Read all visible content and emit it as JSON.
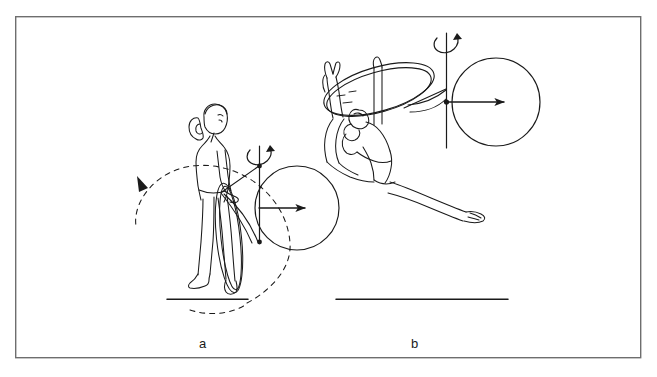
{
  "figure": {
    "type": "line-drawing-diagram",
    "background_color": "#ffffff",
    "ink_color": "#1a1a1a",
    "border": {
      "name": "figure-border",
      "x": 15,
      "y": 16,
      "width": 626,
      "height": 342,
      "stroke": "#6e6e6e",
      "stroke_width": 1.4
    },
    "panels": [
      {
        "id": "a",
        "label": "a",
        "label_x": 199,
        "label_y": 337,
        "description": "Gymnast standing upright in profile holding a hoop at the hip; dashed circular arrow shows hoop swing path; vertical rotation axis with curved spin arrow and a circle with a horizontal arrow representing the angular momentum vector.",
        "ground_line": {
          "x1": 167,
          "y1": 299,
          "x2": 248,
          "y2": 299
        },
        "axis": {
          "x": 259,
          "y_top": 146,
          "y_bottom": 243
        },
        "spin_arrow": {
          "cx": 264,
          "cy": 152,
          "direction": "counterclockwise-about-vertical-axis"
        },
        "momentum_circle": {
          "cx": 297,
          "cy": 208,
          "r": 42
        },
        "momentum_arrow": {
          "x1": 259,
          "y1": 208,
          "x2": 307,
          "y2": 208,
          "direction": "right"
        },
        "dashed_arc": {
          "description": "dashed near-full circle traced counterclockwise with arrowhead at upper left",
          "cx": 212,
          "cy": 245,
          "rx": 78,
          "ry": 73
        }
      },
      {
        "id": "b",
        "label": "b",
        "label_x": 411,
        "label_y": 337,
        "description": "Gymnast in a horizontal flight / split-leap position passing through the hoop; vertical rotation axis with curved spin arrow and a circle with a horizontal arrow representing the angular momentum vector.",
        "ground_line": {
          "x1": 336,
          "y1": 299,
          "x2": 508,
          "y2": 299
        },
        "axis": {
          "x": 446,
          "y_top": 33,
          "y_bottom": 148
        },
        "spin_arrow": {
          "cx": 451,
          "cy": 40,
          "direction": "counterclockwise-about-vertical-axis"
        },
        "momentum_circle": {
          "cx": 496,
          "cy": 102,
          "r": 44
        },
        "momentum_arrow": {
          "x1": 446,
          "y1": 102,
          "x2": 505,
          "y2": 102,
          "direction": "right"
        },
        "hoop": {
          "description": "tilted elliptical hoop rendered as a double-line ring",
          "cx": 379,
          "cy": 88,
          "rx": 56,
          "ry": 21,
          "rotation_deg": -17
        }
      }
    ],
    "legend_items": []
  }
}
